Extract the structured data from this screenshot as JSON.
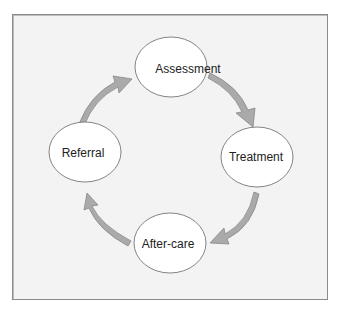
{
  "diagram": {
    "type": "cycle",
    "nodes": [
      {
        "id": "assessment",
        "label": "Assessment"
      },
      {
        "id": "treatment",
        "label": "Treatment"
      },
      {
        "id": "after_care",
        "label": "After-care"
      },
      {
        "id": "referral",
        "label": "Referral"
      }
    ],
    "edges": [
      {
        "from": "assessment",
        "to": "treatment"
      },
      {
        "from": "treatment",
        "to": "after_care"
      },
      {
        "from": "after_care",
        "to": "referral"
      },
      {
        "from": "referral",
        "to": "assessment"
      }
    ],
    "colors": {
      "background": "#f3f3f3",
      "node_fill": "#ffffff",
      "node_stroke": "#777777",
      "arrow_fill": "#aaaaaa",
      "arrow_stroke": "#888888",
      "frame_border": "#8a8a8a"
    }
  }
}
